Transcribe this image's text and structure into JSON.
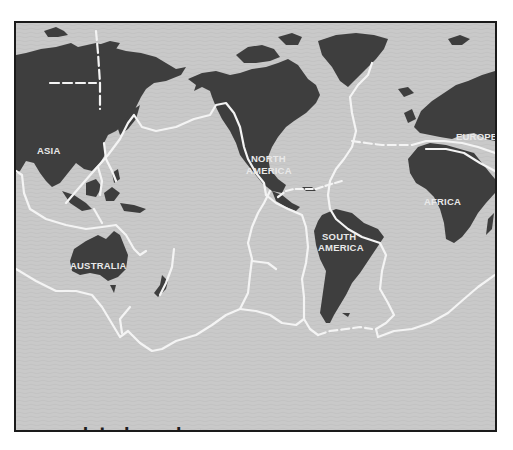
{
  "map": {
    "type": "world tectonic plate boundary map",
    "colors": {
      "ocean": "#c9c9c9",
      "land": "#3e3e3e",
      "boundary": "#f4f4f4",
      "label": "#e9e9e9",
      "frame": "#1a1a1a"
    },
    "continent_labels": {
      "asia": "ASIA",
      "north_america_line1": "NORTH",
      "north_america_line2": "AMERICA",
      "europe": "EUROPE",
      "africa": "AFRICA",
      "south_america_line1": "SOUTH",
      "south_america_line2": "AMERICA",
      "australia": "AUSTRALIA"
    }
  },
  "legend": {
    "items": [
      {
        "symbol": "white line",
        "label": "plate boundary"
      }
    ]
  }
}
